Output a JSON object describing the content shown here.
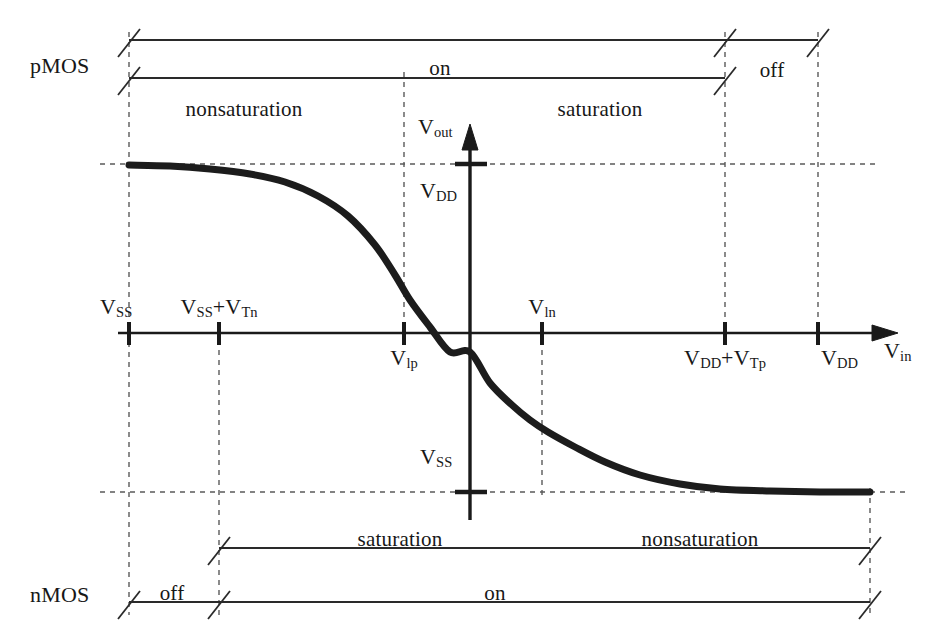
{
  "figure": {
    "type": "cmos-inverter-voltage-transfer-characteristic",
    "title": "",
    "axes": {
      "x_axis_label": "V",
      "x_axis_sub": "in",
      "y_axis_label": "V",
      "y_axis_sub": "out"
    },
    "x_ticks": [
      {
        "id": "vss",
        "main": "V",
        "sub": "SS",
        "extra": "",
        "extra_sub": "",
        "x": 129,
        "label_x": 100,
        "label_y": 296,
        "align": "left",
        "dashed": true
      },
      {
        "id": "vss_vtn",
        "main": "V",
        "sub": "SS",
        "extra": "+V",
        "extra_sub": "Tn",
        "x": 219,
        "label_x": 219,
        "label_y": 296,
        "align": "center",
        "dashed": true
      },
      {
        "id": "vlp",
        "main": "V",
        "sub": "lp",
        "extra": "",
        "extra_sub": "",
        "x": 404,
        "label_x": 404,
        "label_y": 347,
        "align": "center",
        "dashed": true
      },
      {
        "id": "vln",
        "main": "V",
        "sub": "ln",
        "extra": "",
        "extra_sub": "",
        "x": 542,
        "label_x": 542,
        "label_y": 296,
        "align": "center",
        "dashed": true
      },
      {
        "id": "vdd_vtp",
        "main": "V",
        "sub": "DD",
        "extra": "+V",
        "extra_sub": "Tp",
        "x": 725,
        "label_x": 725,
        "label_y": 347,
        "align": "center",
        "dashed": true
      },
      {
        "id": "vdd",
        "main": "V",
        "sub": "DD",
        "extra": "",
        "extra_sub": "",
        "x": 818,
        "label_x": 821,
        "label_y": 347,
        "align": "left",
        "dashed": true
      }
    ],
    "y_levels": [
      {
        "id": "vdd_level",
        "main": "V",
        "sub": "DD",
        "y": 164,
        "label_x": 420,
        "label_y": 180
      },
      {
        "id": "vss_level",
        "main": "V",
        "sub": "SS",
        "y": 492,
        "label_x": 420,
        "label_y": 446
      }
    ],
    "pmos": {
      "device_label": "pMOS",
      "device_label_x": 30,
      "device_label_y": 55,
      "outer_bracket": {
        "y": 40,
        "x1": 129,
        "x2": 818,
        "gap_label": "off",
        "gap_label_x": 772,
        "gap_label_y": 60
      },
      "inner_bracket": {
        "y": 78,
        "x1": 129,
        "x2": 725,
        "gap_label": "on",
        "gap_label_x": 440,
        "gap_label_y": 58
      },
      "regions": [
        {
          "label": "nonsaturation",
          "x": 244,
          "y": 99
        },
        {
          "label": "saturation",
          "x": 600,
          "y": 99
        }
      ]
    },
    "nmos": {
      "device_label": "nMOS",
      "device_label_x": 30,
      "device_label_y": 584,
      "outer_bracket": {
        "y": 602,
        "x1": 129,
        "x2": 870,
        "gap_label": "off",
        "gap_label_x": 172,
        "gap_label_y": 583
      },
      "inner_bracket": {
        "y": 548,
        "x1": 219,
        "x2": 870,
        "gap_label": "on",
        "gap_label_x": 495,
        "gap_label_y": 583
      },
      "regions": [
        {
          "label": "saturation",
          "x": 400,
          "y": 529
        },
        {
          "label": "nonsaturation",
          "x": 700,
          "y": 529
        }
      ]
    },
    "curve": {
      "description": "CMOS inverter VTC, monotonically decreasing from V_DD at V_SS to V_SS at V_DD",
      "stroke_width": 7,
      "points": [
        [
          129,
          165
        ],
        [
          170,
          166
        ],
        [
          210,
          169
        ],
        [
          250,
          174
        ],
        [
          285,
          182
        ],
        [
          318,
          196
        ],
        [
          348,
          216
        ],
        [
          375,
          245
        ],
        [
          395,
          275
        ],
        [
          410,
          300
        ],
        [
          430,
          327
        ],
        [
          450,
          352
        ],
        [
          470,
          333
        ],
        [
          490,
          383
        ],
        [
          512,
          405
        ],
        [
          530,
          420
        ],
        [
          548,
          432
        ],
        [
          575,
          447
        ],
        [
          605,
          462
        ],
        [
          640,
          475
        ],
        [
          680,
          484
        ],
        [
          720,
          489
        ],
        [
          770,
          491
        ],
        [
          820,
          492
        ],
        [
          870,
          492
        ]
      ]
    },
    "colors": {
      "ink": "#1a1a1a",
      "curve": "#1c1c1c",
      "dashed": "#555555",
      "background": "#ffffff"
    }
  }
}
